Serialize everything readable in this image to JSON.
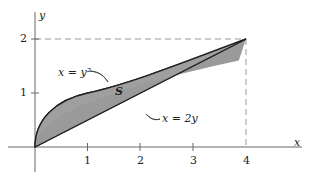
{
  "diagram": {
    "axes": {
      "x_label": "x",
      "y_label": "y",
      "x_ticks": [
        "1",
        "2",
        "3",
        "4"
      ],
      "y_ticks": [
        "1",
        "2"
      ]
    },
    "curves": {
      "parabola_label": "x = y²",
      "line_label": "x = 2y"
    },
    "region_label": "S",
    "colors": {
      "fill": "#9a9a9a",
      "stroke": "#222222",
      "dashed": "#888888"
    }
  }
}
